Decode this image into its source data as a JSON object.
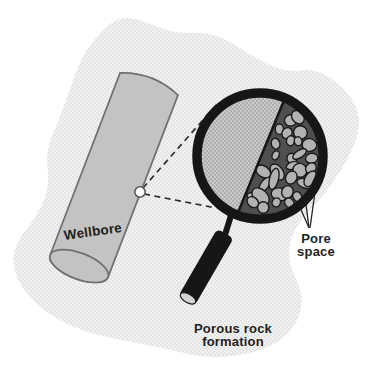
{
  "figure": {
    "labels": {
      "wellbore": "Wellbore",
      "pore_space": [
        "Pore",
        "space"
      ],
      "formation": [
        "Porous rock",
        "formation"
      ]
    },
    "icons": {
      "magnifier": "magnifying-glass-icon",
      "sample_point": "circle-marker-icon"
    },
    "colors": {
      "page_background": "#ffffff",
      "formation_fill": "#f1f1f1",
      "formation_dot": "#d3d3d3",
      "wellbore_fill": "#c3c3c3",
      "wellbore_outline": "#6f6f6f",
      "magnifier_black": "#161616",
      "lens_matrix_fill": "#c9c9c9",
      "lens_matrix_dot": "#8f8f8f",
      "grain_fill": "#b2b2b2",
      "grain_outline": "#1a1a1a",
      "pore_fill": "#4f4f4f",
      "marker_fill": "#ffffff",
      "marker_outline": "#5a5a5a",
      "dashed_line": "#2e2e2e",
      "text": "#1f1f1f"
    }
  }
}
